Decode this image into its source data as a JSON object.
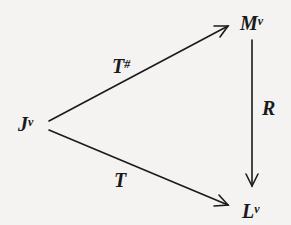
{
  "diagram": {
    "type": "commutative-triangle",
    "nodes": [
      {
        "id": "J",
        "base": "J",
        "sup": "ν"
      },
      {
        "id": "M",
        "base": "M",
        "sup": "ν"
      },
      {
        "id": "L",
        "base": "L",
        "sup": "ν"
      }
    ],
    "edges": [
      {
        "from": "J",
        "to": "M",
        "label_base": "T",
        "label_sup": "#"
      },
      {
        "from": "M",
        "to": "L",
        "label_base": "R",
        "label_sup": ""
      },
      {
        "from": "J",
        "to": "L",
        "label_base": "T",
        "label_sup": ""
      }
    ],
    "colors": {
      "ink": "#1a1a1a",
      "background": "#f4f3f1"
    }
  }
}
